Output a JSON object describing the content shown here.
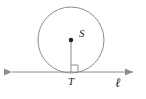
{
  "figure": {
    "type": "geometry-diagram",
    "canvas": {
      "width": 146,
      "height": 99,
      "background": "#ffffff"
    },
    "style": {
      "stroke_color": "#8c8c8c",
      "label_color": "#231f20",
      "point_color": "#231f20",
      "stroke_width": 1
    },
    "circle": {
      "name": "circle-S",
      "center_x": 71,
      "center_y": 40,
      "radius": 33
    },
    "points": [
      {
        "id": "center-point-s",
        "label": "S",
        "x": 71,
        "y": 40,
        "label_x": 79,
        "label_y": 37,
        "dot_radius": 2.2
      },
      {
        "id": "tangent-point-t",
        "label": "T",
        "x": 71,
        "y": 72,
        "label_x": 71,
        "label_y": 85,
        "dot_radius": 0
      }
    ],
    "radius_segment": {
      "name": "radius-s-to-t",
      "x1": 71,
      "y1": 40,
      "x2": 71,
      "y2": 72
    },
    "tangent_line": {
      "name": "line-l",
      "label": "ℓ",
      "x1": 5,
      "y1": 72,
      "x2": 140,
      "y2": 72,
      "label_x": 118,
      "label_y": 87,
      "arrow_left": true,
      "arrow_right": true
    },
    "right_angle_marker": {
      "name": "right-angle-at-t",
      "x": 71,
      "y": 72,
      "size": 7,
      "direction": "right-up"
    }
  }
}
